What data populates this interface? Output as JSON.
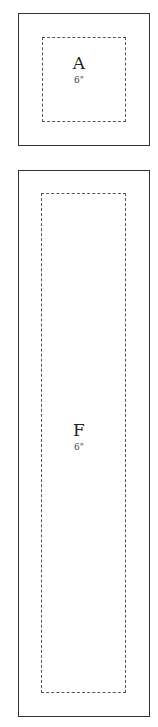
{
  "pieces": [
    {
      "letter": "A",
      "size": "6\""
    },
    {
      "letter": "F",
      "size": "6\""
    }
  ]
}
